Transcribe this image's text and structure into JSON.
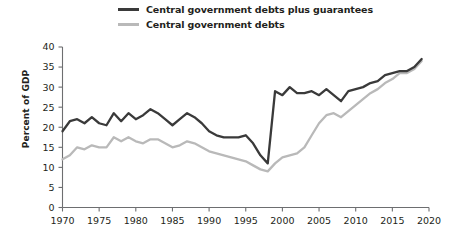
{
  "chart_data": {
    "type": "line",
    "title": "",
    "xlabel": "",
    "ylabel": "Percent of GDP",
    "xlim": [
      1970,
      2020
    ],
    "ylim": [
      0,
      40
    ],
    "xticks": [
      1970,
      1975,
      1980,
      1985,
      1990,
      1995,
      2000,
      2005,
      2010,
      2015,
      2020
    ],
    "yticks": [
      0,
      5,
      10,
      15,
      20,
      25,
      30,
      35,
      40
    ],
    "grid": false,
    "legend_position": "top",
    "colors": {
      "series_1": "#3a3a3a",
      "series_2": "#b9b9b9",
      "axis": "#6d6e70",
      "text": "#231f20"
    },
    "x": [
      1970,
      1971,
      1972,
      1973,
      1974,
      1975,
      1976,
      1977,
      1978,
      1979,
      1980,
      1981,
      1982,
      1983,
      1984,
      1985,
      1986,
      1987,
      1988,
      1989,
      1990,
      1991,
      1992,
      1993,
      1994,
      1995,
      1996,
      1997,
      1998,
      1999,
      2000,
      2001,
      2002,
      2003,
      2004,
      2005,
      2006,
      2007,
      2008,
      2009,
      2010,
      2011,
      2012,
      2013,
      2014,
      2015,
      2016,
      2017,
      2018,
      2019
    ],
    "series": [
      {
        "name": "Central government debts plus guarantees",
        "color": "#3a3a3a",
        "values": [
          19.0,
          21.5,
          22.0,
          21.0,
          22.5,
          21.0,
          20.5,
          23.5,
          21.5,
          23.5,
          22.0,
          23.0,
          24.5,
          23.5,
          22.0,
          20.5,
          22.0,
          23.5,
          22.5,
          21.0,
          19.0,
          18.0,
          17.5,
          17.5,
          17.5,
          18.0,
          16.0,
          13.0,
          11.0,
          29.0,
          28.0,
          30.0,
          28.5,
          28.5,
          29.0,
          28.0,
          29.5,
          28.0,
          26.5,
          29.0,
          29.5,
          30.0,
          31.0,
          31.5,
          33.0,
          33.5,
          34.0,
          34.0,
          35.0,
          37.0
        ]
      },
      {
        "name": "Central government debts",
        "color": "#b9b9b9",
        "values": [
          12.0,
          13.0,
          15.0,
          14.5,
          15.5,
          15.0,
          15.0,
          17.5,
          16.5,
          17.5,
          16.5,
          16.0,
          17.0,
          17.0,
          16.0,
          15.0,
          15.5,
          16.5,
          16.0,
          15.0,
          14.0,
          13.5,
          13.0,
          12.5,
          12.0,
          11.5,
          10.5,
          9.5,
          9.0,
          11.0,
          12.5,
          13.0,
          13.5,
          15.0,
          18.0,
          21.0,
          23.0,
          23.5,
          22.5,
          24.0,
          25.5,
          27.0,
          28.5,
          29.5,
          31.0,
          32.0,
          33.5,
          33.5,
          34.5,
          36.5
        ]
      }
    ]
  },
  "legend": {
    "items": [
      {
        "label": "Central government debts plus guarantees",
        "style": "dark"
      },
      {
        "label": "Central government debts",
        "style": "light"
      }
    ]
  },
  "axes": {
    "ylabel": "Percent of GDP"
  }
}
